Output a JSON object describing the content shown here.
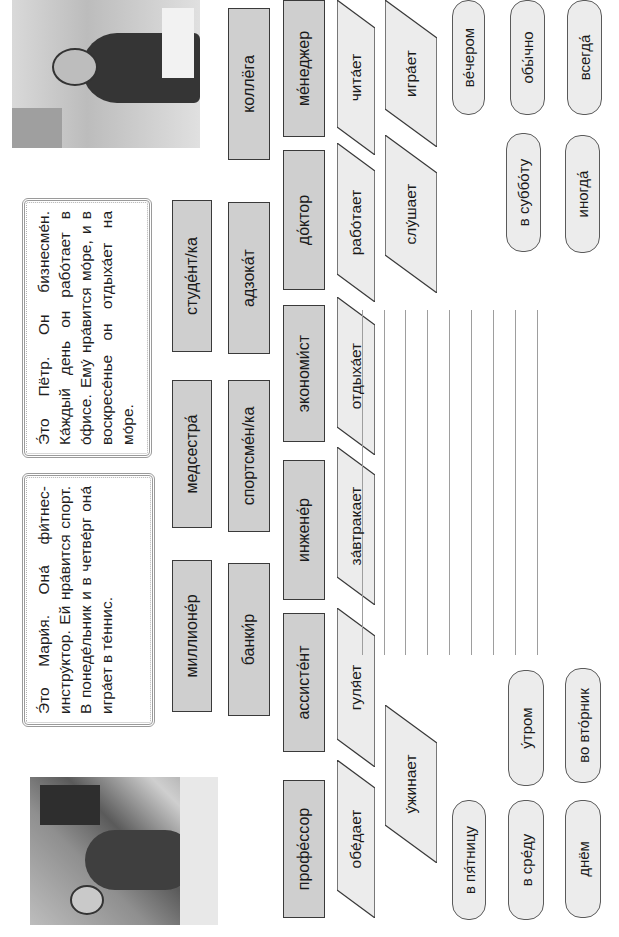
{
  "worksheet": {
    "pyotr": {
      "photo_label": "businessman-photo",
      "text": "Э́то Пётр. Он бизнесме́н. Ка́ждый день он рабо́тает в о́фисе. Ему́ нра́вится мо́ре, и в воскресе́нье он отдыха́ет на мо́ре."
    },
    "maria": {
      "photo_label": "fitness-instructor-photo",
      "text": "Э́то Мари́я. Она́ фи́тнес-инстру́ктор. Ей нра́вится спорт. В понеде́льник и в четве́рг она́ игра́ет в те́ннис."
    },
    "professions": [
      {
        "label": "студе́нт/ка"
      },
      {
        "label": "медсестра́"
      },
      {
        "label": "миллионе́р"
      },
      {
        "label": "коллёга"
      },
      {
        "label": "адзока́т"
      },
      {
        "label": "спортсме́н/ка"
      },
      {
        "label": "банки́р"
      },
      {
        "label": "ме́неджер"
      },
      {
        "label": "до́ктор"
      },
      {
        "label": "экономи́ст"
      },
      {
        "label": "инжене́р"
      },
      {
        "label": "ассисте́нт"
      },
      {
        "label": "профе́ссор"
      }
    ],
    "verbs": [
      {
        "label": "чита́ет"
      },
      {
        "label": "рабо́тает"
      },
      {
        "label": "отдыха́ет"
      },
      {
        "label": "за́втракает"
      },
      {
        "label": "гуля́ет"
      },
      {
        "label": "обе́дает"
      },
      {
        "label": "игра́ет"
      },
      {
        "label": "слу́шает"
      },
      {
        "label": "у́жинает"
      }
    ],
    "time_expressions": [
      {
        "label": "ве́чером"
      },
      {
        "label": "обы́чно"
      },
      {
        "label": "всегда́"
      },
      {
        "label": "в суббо́ту"
      },
      {
        "label": "иногда́"
      },
      {
        "label": "у́тром"
      },
      {
        "label": "во вто́рник"
      },
      {
        "label": "в пя́тницу"
      },
      {
        "label": "в сре́ду"
      },
      {
        "label": "днём"
      }
    ],
    "answer_lines_count": 9,
    "colors": {
      "profession_fill": "#cfcfcf",
      "verb_fill": "#ececec",
      "pill_fill": "#ececec",
      "border": "#3a3a3a",
      "line": "#9e9e9e"
    }
  }
}
